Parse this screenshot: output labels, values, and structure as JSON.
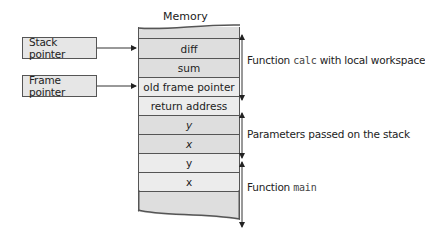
{
  "diagram": {
    "memory_title": "Memory",
    "pointers": [
      {
        "label": "Stack pointer",
        "points_to_row": 0
      },
      {
        "label": "Frame pointer",
        "points_to_row": 2
      }
    ],
    "rows": [
      {
        "label": "diff",
        "italic": false
      },
      {
        "label": "sum",
        "italic": false
      },
      {
        "label": "old frame pointer",
        "italic": false
      },
      {
        "label": "return address",
        "italic": false
      },
      {
        "label": "y",
        "italic": true
      },
      {
        "label": "x",
        "italic": true
      },
      {
        "label": "y",
        "italic": false
      },
      {
        "label": "x",
        "italic": false
      },
      {
        "label": "",
        "italic": false
      }
    ],
    "brackets": [
      {
        "prefix": "Function ",
        "code": "calc",
        "suffix": " with local workspace"
      },
      {
        "prefix": "Parameters passed on the stack",
        "code": "",
        "suffix": ""
      },
      {
        "prefix": "Function ",
        "code": "main",
        "suffix": ""
      }
    ],
    "colors": {
      "box_fill": "#e6e6e6",
      "row_dark": "#dedede",
      "row_light": "#ececec",
      "line": "#555555"
    }
  }
}
